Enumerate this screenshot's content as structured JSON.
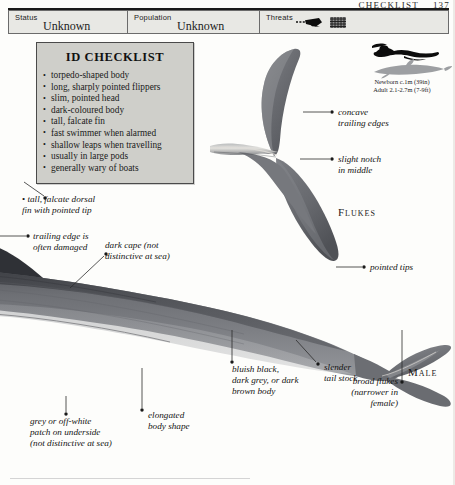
{
  "page": {
    "running_head": "CHECKLIST 137",
    "running_head_title": "CHECKLIST",
    "running_head_page": "137"
  },
  "statusbar": {
    "status": {
      "label": "Status",
      "value": "Unknown"
    },
    "population": {
      "label": "Population",
      "value": "Unknown"
    },
    "threats": {
      "label": "Threats",
      "icons": [
        "harpoon-icon",
        "net-icon"
      ]
    }
  },
  "checklist": {
    "title": "ID CHECKLIST",
    "items": [
      "torpedo-shaped body",
      "long, sharply pointed flippers",
      "slim, pointed head",
      "dark-coloured body",
      "tall, falcate fin",
      "fast swimmer when alarmed",
      "shallow leaps when travelling",
      "usually in large pods",
      "generally wary of boats"
    ]
  },
  "size_comparison": {
    "human_icon": "swimmer-silhouette-icon",
    "animal_icon": "dolphin-silhouette-icon",
    "newborn": "Newborn c.1m (39in)",
    "adult": "Adult 2.1-2.7m (7-9ft)"
  },
  "section_labels": {
    "flukes": "Flukes",
    "male": "Male"
  },
  "annotations": [
    {
      "name": "concave-trailing-edges",
      "lines": [
        "concave",
        "trailing edges"
      ]
    },
    {
      "name": "slight-notch-in-middle",
      "lines": [
        "slight notch",
        "in middle"
      ]
    },
    {
      "name": "pointed-tips",
      "lines": [
        "pointed tips"
      ]
    },
    {
      "name": "tall-falcate-dorsal-fin",
      "lines": [
        "tall, falcate dorsal",
        "fin with pointed tip"
      ]
    },
    {
      "name": "trailing-edge-damaged",
      "lines": [
        "trailing edge is",
        "often damaged"
      ]
    },
    {
      "name": "dark-cape",
      "lines": [
        "dark cape (not",
        "distinctive at sea)"
      ]
    },
    {
      "name": "grey-patch-underside",
      "lines": [
        "grey or off-white",
        "patch on underside",
        "(not distinctive at sea)"
      ]
    },
    {
      "name": "elongated-body-shape",
      "lines": [
        "elongated",
        "body shape"
      ]
    },
    {
      "name": "bluish-black-body",
      "lines": [
        "bluish black,",
        "dark grey, or dark",
        "brown body"
      ]
    },
    {
      "name": "slender-tail-stock",
      "lines": [
        "slender",
        "tail stock"
      ]
    },
    {
      "name": "broad-flukes",
      "lines": [
        "broad flukes",
        "(narrower in",
        "female)"
      ]
    }
  ],
  "colors": {
    "body_dark": "#4e5055",
    "body_mid": "#6f7176",
    "body_light": "#9b9da1",
    "panel_bg": "#cfcfca",
    "bar_bg": "#e8e8e4",
    "ink": "#141414"
  }
}
